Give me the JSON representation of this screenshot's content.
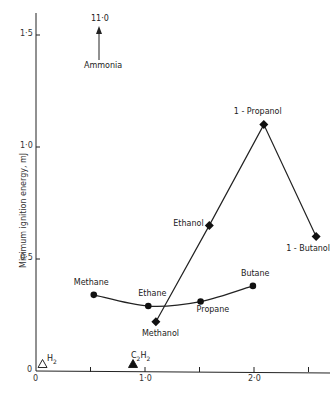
{
  "chart_data": {
    "type": "scatter",
    "title": "",
    "xlabel": "",
    "ylabel": "Minimum ignition energy, mJ",
    "xlim": [
      0,
      2.75
    ],
    "ylim": [
      0,
      1.6
    ],
    "x_ticks": [
      {
        "value": 0,
        "label": "0"
      },
      {
        "value": 0.5,
        "label": ""
      },
      {
        "value": 1.0,
        "label": "1·0"
      },
      {
        "value": 1.5,
        "label": ""
      },
      {
        "value": 2.0,
        "label": "2·0"
      },
      {
        "value": 2.5,
        "label": ""
      }
    ],
    "y_ticks": [
      {
        "value": 0,
        "label": "0"
      },
      {
        "value": 0.5,
        "label": "0·5"
      },
      {
        "value": 1.0,
        "label": "1·0"
      },
      {
        "value": 1.5,
        "label": "1·5"
      }
    ],
    "grid": false,
    "series": [
      {
        "name": "Alkanes",
        "marker": "circle",
        "line": "smooth-curve",
        "points": [
          {
            "label": "Methane",
            "x": 0.53,
            "y": 0.34
          },
          {
            "label": "Ethane",
            "x": 1.03,
            "y": 0.29
          },
          {
            "label": "Propane",
            "x": 1.51,
            "y": 0.31
          },
          {
            "label": "Butane",
            "x": 1.99,
            "y": 0.38
          }
        ]
      },
      {
        "name": "Alcohols",
        "marker": "diamond",
        "line": "straight",
        "points": [
          {
            "label": "Methanol",
            "x": 1.1,
            "y": 0.22
          },
          {
            "label": "Ethanol",
            "x": 1.59,
            "y": 0.65
          },
          {
            "label": "1 - Propanol",
            "x": 2.09,
            "y": 1.1
          },
          {
            "label": "1 - Butanol",
            "x": 2.57,
            "y": 0.6
          }
        ]
      },
      {
        "name": "Other",
        "marker": "triangle",
        "points": [
          {
            "label": "H2",
            "x": 0.06,
            "y": 0.02,
            "filled": false
          },
          {
            "label": "C2H2",
            "x": 0.89,
            "y": 0.02,
            "filled": true
          }
        ]
      }
    ],
    "annotations": [
      {
        "label": "Ammonia",
        "x": 0.58,
        "value_text": "11·0",
        "note": "off-scale arrow pointing up"
      }
    ]
  },
  "labels": {
    "ylabel": "Minimum ignition energy, mJ",
    "ammonia": "Ammonia",
    "ammonia_value": "11·0",
    "h2": "H",
    "h2_sub": "2",
    "c2h2_c": "C",
    "c2h2_sub1": "2",
    "c2h2_h": "H",
    "c2h2_sub2": "2"
  }
}
